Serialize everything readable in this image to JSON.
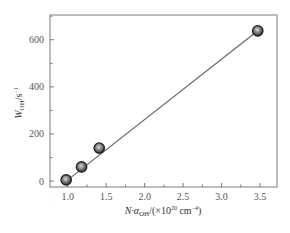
{
  "chart_data": {
    "type": "scatter",
    "title": "",
    "xlabel": "N·α_OH/(×10^20 cm^-4)",
    "ylabel": "W_OH/s^-1",
    "xlim": [
      0.77,
      3.72
    ],
    "ylim": [
      -25,
      705
    ],
    "x_ticks": [
      "1.0",
      "1.5",
      "2.0",
      "2.5",
      "3.0",
      "3.5"
    ],
    "y_ticks": [
      "0",
      "200",
      "400",
      "600"
    ],
    "grid": false,
    "legend": null,
    "series": [
      {
        "name": "measured",
        "type": "scatter",
        "x": [
          0.98,
          1.18,
          1.41,
          3.47
        ],
        "y": [
          5,
          60,
          140,
          638
        ]
      },
      {
        "name": "linear fit",
        "type": "line",
        "x": [
          0.98,
          3.47
        ],
        "y": [
          0,
          638
        ]
      }
    ]
  },
  "labels": {
    "x_main": "N·α",
    "x_sub": "OH",
    "x_rest": "/(×10",
    "x_exp": "20",
    "x_unit": " cm",
    "x_unit_exp": "−4",
    "x_close": ")",
    "y_main": "W",
    "y_sub": "OH",
    "y_rest": "/s",
    "y_exp": "−1"
  },
  "colors": {
    "axis": "#777777",
    "line": "#666666",
    "marker_fill": "#9a9a9a",
    "marker_edge": "#222222"
  }
}
